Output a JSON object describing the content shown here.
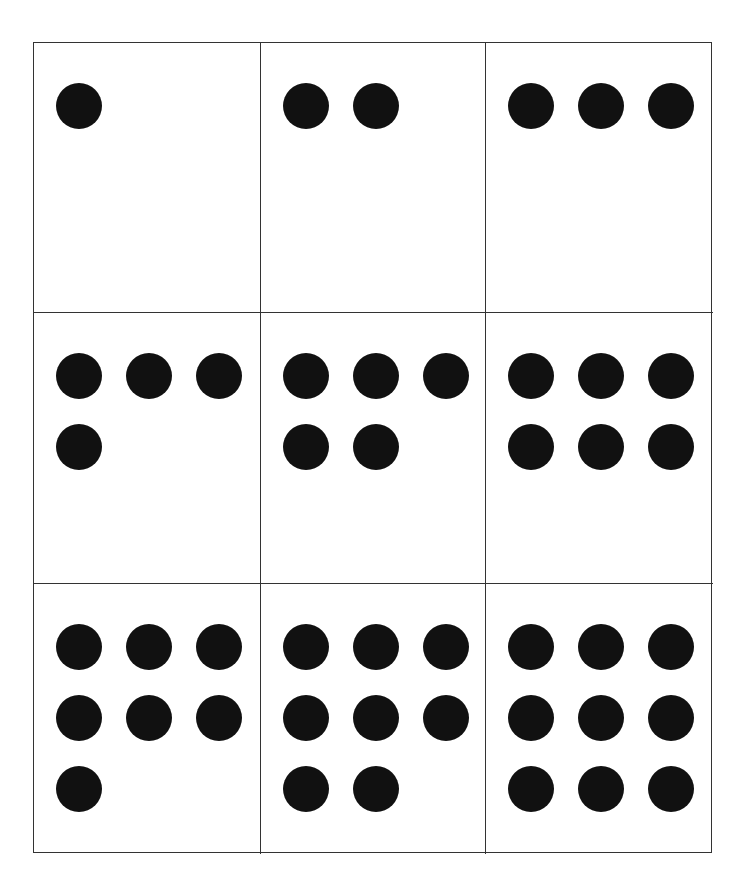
{
  "diagram": {
    "type": "dot-count-cards",
    "layout": {
      "rows": 3,
      "columns": 3,
      "dots_per_row": 3
    },
    "colors": {
      "dot": "#111111",
      "line": "#333333",
      "background": "#ffffff"
    },
    "cells": [
      {
        "count": 1
      },
      {
        "count": 2
      },
      {
        "count": 3
      },
      {
        "count": 4
      },
      {
        "count": 5
      },
      {
        "count": 6
      },
      {
        "count": 7
      },
      {
        "count": 8
      },
      {
        "count": 9
      }
    ]
  }
}
